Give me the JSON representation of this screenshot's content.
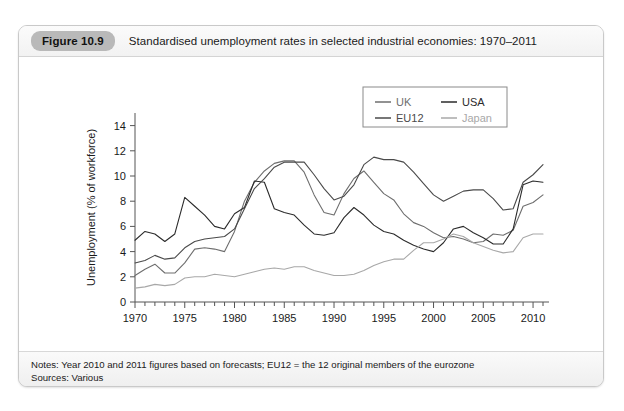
{
  "figure": {
    "badge": "Figure 10.9",
    "title": "Standardised unemployment rates in selected industrial economies: 1970–2011"
  },
  "footer": {
    "notes": "Notes: Year 2010 and 2011 figures based on forecasts; EU12 = the 12 original members of the eurozone",
    "sources": "Sources: Various"
  },
  "colors": {
    "uk": "#6e6e6e",
    "usa": "#2b2b2b",
    "eu12": "#4a4a4a",
    "japan": "#a8a8a8",
    "axis": "#555555",
    "badge_bg": "#b9b9b9",
    "card_border": "#c9c9c9"
  },
  "chart_data": {
    "type": "line",
    "title": "Standardised unemployment rates in selected industrial economies: 1970–2011",
    "xlabel": "",
    "ylabel": "Unemployment (% of workforce)",
    "xlim": [
      1970,
      2011
    ],
    "ylim": [
      0,
      15
    ],
    "yticks": [
      0,
      2,
      4,
      6,
      8,
      10,
      12,
      14
    ],
    "xticks": [
      1970,
      1975,
      1980,
      1985,
      1990,
      1995,
      2000,
      2005,
      2010
    ],
    "x_minor_tick_step": 1,
    "grid": false,
    "legend_position": "upper-center",
    "x": [
      1970,
      1971,
      1972,
      1973,
      1974,
      1975,
      1976,
      1977,
      1978,
      1979,
      1980,
      1981,
      1982,
      1983,
      1984,
      1985,
      1986,
      1987,
      1988,
      1989,
      1990,
      1991,
      1992,
      1993,
      1994,
      1995,
      1996,
      1997,
      1998,
      1999,
      2000,
      2001,
      2002,
      2003,
      2004,
      2005,
      2006,
      2007,
      2008,
      2009,
      2010,
      2011
    ],
    "series": [
      {
        "name": "UK",
        "color": "#6e6e6e",
        "values": [
          2.1,
          2.6,
          3.0,
          2.3,
          2.3,
          3.1,
          4.2,
          4.3,
          4.2,
          4.0,
          5.6,
          8.0,
          9.5,
          10.4,
          11.0,
          11.2,
          11.2,
          10.3,
          8.5,
          7.1,
          6.9,
          8.6,
          9.8,
          10.4,
          9.5,
          8.6,
          8.1,
          7.0,
          6.3,
          6.0,
          5.5,
          5.1,
          5.2,
          5.0,
          4.7,
          4.8,
          5.4,
          5.3,
          5.7,
          7.6,
          7.9,
          8.5
        ]
      },
      {
        "name": "USA",
        "color": "#2b2b2b",
        "values": [
          4.9,
          5.6,
          5.4,
          4.8,
          5.4,
          8.3,
          7.6,
          6.9,
          6.0,
          5.8,
          7.0,
          7.5,
          9.6,
          9.5,
          7.4,
          7.1,
          6.9,
          6.1,
          5.4,
          5.3,
          5.5,
          6.7,
          7.5,
          6.9,
          6.1,
          5.6,
          5.4,
          4.9,
          4.5,
          4.2,
          4.0,
          4.7,
          5.8,
          6.0,
          5.5,
          5.1,
          4.6,
          4.6,
          5.8,
          9.3,
          9.6,
          9.5
        ]
      },
      {
        "name": "EU12",
        "color": "#4a4a4a",
        "values": [
          3.1,
          3.3,
          3.7,
          3.4,
          3.5,
          4.3,
          4.8,
          5.0,
          5.1,
          5.2,
          5.8,
          7.4,
          9.0,
          9.8,
          10.7,
          11.1,
          11.1,
          11.1,
          10.1,
          9.0,
          8.1,
          8.4,
          9.3,
          10.9,
          11.5,
          11.3,
          11.3,
          11.1,
          10.3,
          9.4,
          8.5,
          8.0,
          8.4,
          8.8,
          8.9,
          8.9,
          8.2,
          7.3,
          7.4,
          9.5,
          10.1,
          10.9
        ]
      },
      {
        "name": "Japan",
        "color": "#a8a8a8",
        "values": [
          1.1,
          1.2,
          1.4,
          1.3,
          1.4,
          1.9,
          2.0,
          2.0,
          2.2,
          2.1,
          2.0,
          2.2,
          2.4,
          2.6,
          2.7,
          2.6,
          2.8,
          2.8,
          2.5,
          2.3,
          2.1,
          2.1,
          2.2,
          2.5,
          2.9,
          3.2,
          3.4,
          3.4,
          4.1,
          4.7,
          4.7,
          5.0,
          5.4,
          5.2,
          4.7,
          4.4,
          4.1,
          3.9,
          4.0,
          5.1,
          5.4,
          5.4
        ]
      }
    ]
  },
  "legend": {
    "entries": [
      {
        "label": "UK",
        "color": "#6e6e6e"
      },
      {
        "label": "USA",
        "color": "#2b2b2b"
      },
      {
        "label": "EU12",
        "color": "#4a4a4a"
      },
      {
        "label": "Japan",
        "color": "#a8a8a8"
      }
    ]
  }
}
